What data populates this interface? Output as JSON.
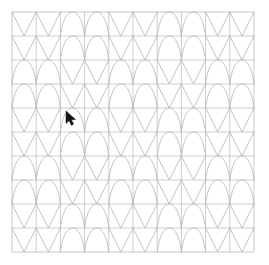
{
  "canvas": {
    "width": 269,
    "height": 265,
    "background_color": "#ffffff"
  },
  "grid": {
    "origin_x": 12,
    "origin_y": 12,
    "cols": 10,
    "rows": 10,
    "cell_width": 24.2,
    "cell_height": 24.0,
    "line_color": "#b9b9b9",
    "line_width": 0.7,
    "border_color": "#b0b0b0"
  },
  "motif": {
    "stroke_color": "#a9a9a9",
    "stroke_width": 0.7,
    "vee_name": "vee-motif",
    "arc_name": "arc-motif",
    "legend": {
      "V": "vee",
      "A": "arc"
    }
  },
  "pattern": {
    "block_size": 2,
    "description": "2x2 checkerboard of vee and arc motifs",
    "rows": [
      [
        "V",
        "V",
        "A",
        "A",
        "V",
        "V",
        "A",
        "A",
        "V",
        "V"
      ],
      [
        "V",
        "V",
        "A",
        "A",
        "V",
        "V",
        "A",
        "A",
        "V",
        "V"
      ],
      [
        "A",
        "A",
        "V",
        "V",
        "A",
        "A",
        "V",
        "V",
        "A",
        "A"
      ],
      [
        "A",
        "A",
        "V",
        "V",
        "A",
        "A",
        "V",
        "V",
        "A",
        "A"
      ],
      [
        "V",
        "V",
        "A",
        "A",
        "V",
        "V",
        "A",
        "A",
        "V",
        "V"
      ],
      [
        "V",
        "V",
        "A",
        "A",
        "V",
        "V",
        "A",
        "A",
        "V",
        "V"
      ],
      [
        "A",
        "A",
        "V",
        "V",
        "A",
        "A",
        "V",
        "V",
        "A",
        "A"
      ],
      [
        "A",
        "A",
        "V",
        "V",
        "A",
        "A",
        "V",
        "V",
        "A",
        "A"
      ],
      [
        "V",
        "V",
        "A",
        "A",
        "V",
        "V",
        "A",
        "A",
        "V",
        "V"
      ],
      [
        "V",
        "V",
        "A",
        "A",
        "V",
        "V",
        "A",
        "A",
        "V",
        "V"
      ]
    ]
  },
  "cursor": {
    "x": 66,
    "y": 111,
    "color": "#141414",
    "outline_color": "#ffffff",
    "label": "mouse-pointer"
  }
}
